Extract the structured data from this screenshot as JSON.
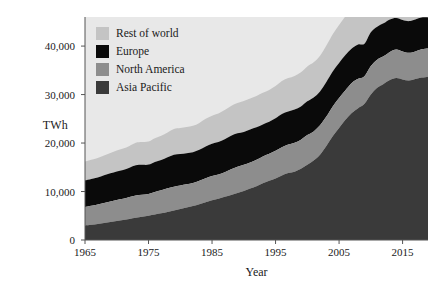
{
  "chart_data": {
    "type": "area",
    "title": "",
    "subtitle": "",
    "xlabel": "Year",
    "ylabel": "TWh",
    "stacked": true,
    "grid": false,
    "legend_position": "top-left",
    "xlim": [
      1965,
      2019
    ],
    "ylim": [
      0,
      46000
    ],
    "xticks": [
      1965,
      1975,
      1985,
      1995,
      2005,
      2015
    ],
    "xtick_labels": [
      "1965",
      "1975",
      "1985",
      "1995",
      "2005",
      "2015"
    ],
    "yticks": [
      0,
      10000,
      20000,
      30000,
      40000
    ],
    "ytick_labels": [
      "0",
      "10,000",
      "20,000",
      "30,000",
      "40,000"
    ],
    "x": [
      1965,
      1966,
      1967,
      1968,
      1969,
      1970,
      1971,
      1972,
      1973,
      1974,
      1975,
      1976,
      1977,
      1978,
      1979,
      1980,
      1981,
      1982,
      1983,
      1984,
      1985,
      1986,
      1987,
      1988,
      1989,
      1990,
      1991,
      1992,
      1993,
      1994,
      1995,
      1996,
      1997,
      1998,
      1999,
      2000,
      2001,
      2002,
      2003,
      2004,
      2005,
      2006,
      2007,
      2008,
      2009,
      2010,
      2011,
      2012,
      2013,
      2014,
      2015,
      2016,
      2017,
      2018,
      2019
    ],
    "series": [
      {
        "name": "Asia Pacific",
        "color": "#3a3a3a",
        "values": [
          3000,
          3150,
          3300,
          3500,
          3700,
          3900,
          4100,
          4350,
          4600,
          4800,
          5000,
          5250,
          5500,
          5800,
          6100,
          6400,
          6700,
          7000,
          7400,
          7800,
          8200,
          8500,
          8900,
          9300,
          9700,
          10100,
          10600,
          11100,
          11700,
          12200,
          12700,
          13300,
          13800,
          14100,
          14700,
          15500,
          16400,
          17600,
          19400,
          21400,
          23100,
          24800,
          26200,
          27200,
          28100,
          30000,
          31400,
          32200,
          33000,
          33400,
          33100,
          32900,
          33200,
          33500,
          33700
        ]
      },
      {
        "name": "North America",
        "color": "#8d8d8d",
        "values": [
          3800,
          3900,
          4000,
          4150,
          4250,
          4350,
          4400,
          4500,
          4600,
          4550,
          4500,
          4650,
          4750,
          4850,
          4900,
          4850,
          4800,
          4750,
          4800,
          4950,
          5000,
          5000,
          5100,
          5300,
          5400,
          5400,
          5400,
          5450,
          5550,
          5600,
          5700,
          5850,
          5900,
          5950,
          6000,
          6150,
          6000,
          6050,
          6050,
          6150,
          6200,
          6100,
          6200,
          6050,
          5700,
          5900,
          5800,
          5700,
          5800,
          5900,
          5800,
          5700,
          5700,
          5850,
          5800
        ]
      },
      {
        "name": "Europe",
        "color": "#0a0a0a",
        "values": [
          5500,
          5550,
          5600,
          5700,
          5800,
          5900,
          5950,
          6050,
          6200,
          6150,
          6050,
          6200,
          6250,
          6400,
          6600,
          6500,
          6400,
          6350,
          6400,
          6550,
          6650,
          6700,
          6800,
          6900,
          6900,
          6800,
          6800,
          6700,
          6600,
          6600,
          6700,
          6850,
          6800,
          6850,
          6850,
          6950,
          7000,
          7000,
          7150,
          7200,
          7200,
          7250,
          7100,
          7100,
          6700,
          6950,
          6800,
          6800,
          6700,
          6500,
          6500,
          6550,
          6600,
          6550,
          6400
        ]
      },
      {
        "name": "Rest of world",
        "color": "#c4c4c4",
        "values": [
          3900,
          3950,
          4000,
          4100,
          4200,
          4300,
          4400,
          4500,
          4650,
          4700,
          4750,
          4900,
          5000,
          5150,
          5300,
          5350,
          5400,
          5450,
          5550,
          5700,
          5800,
          5900,
          6000,
          6150,
          6250,
          6350,
          6400,
          6450,
          6500,
          6550,
          6650,
          6800,
          6900,
          6950,
          7050,
          7200,
          7250,
          7350,
          7500,
          7700,
          7850,
          8000,
          8100,
          8200,
          8150,
          8400,
          8500,
          8550,
          8600,
          8700,
          8750,
          8850,
          8950,
          9050,
          9100
        ]
      }
    ],
    "totals_first": 16200,
    "totals_last": 55000
  },
  "axes": {
    "y_title": "TWh",
    "x_title": "Year"
  },
  "legend": {
    "items": [
      {
        "label": "Rest of world",
        "color": "#c4c4c4"
      },
      {
        "label": "Europe",
        "color": "#0a0a0a"
      },
      {
        "label": "North America",
        "color": "#8d8d8d"
      },
      {
        "label": "Asia Pacific",
        "color": "#3a3a3a"
      }
    ]
  },
  "style": {
    "plot_background": "#e8e8e8",
    "figure_background": "#ffffff",
    "axis_color": "#555555",
    "text_color": "#1a1a1a"
  }
}
